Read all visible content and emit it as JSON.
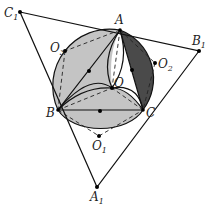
{
  "diagram": {
    "type": "geometry",
    "colors": {
      "light_fill": "#c4c4c4",
      "dark_fill": "#4a4a4a",
      "stroke": "#111111",
      "background": "#ffffff"
    },
    "points": {
      "A": {
        "label": "A",
        "x": 120,
        "y": 30
      },
      "B": {
        "label": "B",
        "x": 58,
        "y": 110
      },
      "C": {
        "label": "C",
        "x": 143,
        "y": 110
      },
      "O": {
        "label": "O",
        "x": 112,
        "y": 88
      },
      "A1": {
        "label": "A",
        "sub": "1",
        "x": 97,
        "y": 187
      },
      "B1": {
        "label": "B",
        "sub": "1",
        "x": 199,
        "y": 51
      },
      "C1": {
        "label": "C",
        "sub": "1",
        "x": 20,
        "y": 12
      },
      "O1": {
        "label": "O",
        "sub": "1",
        "x": 99,
        "y": 136
      },
      "O2": {
        "label": "O",
        "sub": "2",
        "x": 155,
        "y": 63
      },
      "O3": {
        "label": "O",
        "sub": "3",
        "x": 65,
        "y": 51
      },
      "M_AB": {
        "x": 89,
        "y": 71
      },
      "M_AC": {
        "x": 132,
        "y": 70
      },
      "M_BC": {
        "x": 100,
        "y": 111
      }
    },
    "labels": [
      {
        "id": "A",
        "text": "A",
        "sub": ""
      },
      {
        "id": "B",
        "text": "B",
        "sub": ""
      },
      {
        "id": "C",
        "text": "C",
        "sub": ""
      },
      {
        "id": "O",
        "text": "O",
        "sub": ""
      },
      {
        "id": "A1",
        "text": "A",
        "sub": "1"
      },
      {
        "id": "B1",
        "text": "B",
        "sub": "1"
      },
      {
        "id": "C1",
        "text": "C",
        "sub": "1"
      },
      {
        "id": "O1",
        "text": "O",
        "sub": "1"
      },
      {
        "id": "O2",
        "text": "O",
        "sub": "2"
      },
      {
        "id": "O3",
        "text": "O",
        "sub": "3"
      }
    ],
    "segments_solid": [
      "C1B1",
      "B1A1",
      "A1C1",
      "AB",
      "AC",
      "BC"
    ],
    "segments_dashed": [
      "AO3",
      "O3B",
      "AO2",
      "O2C",
      "BO1",
      "O1C",
      "AO",
      "BO",
      "CO"
    ]
  }
}
